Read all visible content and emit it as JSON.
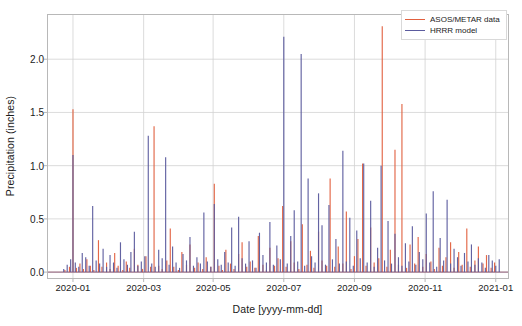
{
  "chart_data": {
    "type": "line",
    "title": "",
    "subtitle": "",
    "xlabel": "Date [yyyy-mm-dd]",
    "ylabel": "Precipitation (inches)",
    "xlim": [
      "2019-12-20",
      "2021-01-10"
    ],
    "ylim": [
      -0.06,
      2.42
    ],
    "grid": true,
    "grid_color": "#d0d0d0",
    "legend_position": "top-right",
    "xticks": [
      "2020-01",
      "2020-03",
      "2020-05",
      "2020-07",
      "2020-09",
      "2020-11",
      "2021-01"
    ],
    "xtick_days": [
      11,
      72,
      132,
      193,
      254,
      315,
      376
    ],
    "yticks": [
      0.0,
      0.5,
      1.0,
      1.5,
      2.0
    ],
    "ytick_labels": [
      "0.0",
      "0.5",
      "1.0",
      "1.5",
      "2.0"
    ],
    "colors": {
      "asos_metar": "#e2603f",
      "hrrr": "#5b5b9e",
      "axes": "#b8b8b8",
      "grid": "#d2d2d2",
      "text": "#1a1a1a"
    },
    "series": [
      {
        "name": "ASOS/METAR data",
        "color": "#e2603f",
        "unit": "inches",
        "x_day": [
          4,
          8,
          11,
          14,
          17,
          20,
          23,
          26,
          29,
          33,
          36,
          40,
          43,
          47,
          50,
          54,
          57,
          60,
          64,
          67,
          71,
          74,
          78,
          81,
          85,
          88,
          92,
          95,
          98,
          102,
          105,
          109,
          112,
          116,
          119,
          123,
          126,
          130,
          133,
          137,
          140,
          143,
          147,
          150,
          154,
          157,
          161,
          164,
          168,
          171,
          175,
          178,
          181,
          185,
          188,
          192,
          195,
          199,
          202,
          206,
          209,
          213,
          216,
          219,
          223,
          226,
          230,
          233,
          237,
          240,
          244,
          247,
          251,
          254,
          257,
          261,
          264,
          268,
          271,
          275,
          278,
          282,
          285,
          289,
          292,
          295,
          299,
          302,
          306,
          309,
          313,
          316,
          320,
          323,
          327,
          330,
          333,
          337,
          340,
          344,
          347,
          351,
          354,
          358,
          361,
          365,
          368,
          372,
          375
        ],
        "values": [
          0.02,
          0.05,
          1.53,
          0.04,
          0.08,
          0.03,
          0.12,
          0.06,
          0.02,
          0.3,
          0.05,
          0.09,
          0.03,
          0.18,
          0.06,
          0.02,
          0.1,
          0.04,
          0.22,
          0.07,
          0.03,
          0.15,
          0.05,
          1.37,
          0.06,
          0.03,
          0.11,
          0.41,
          0.05,
          0.02,
          0.19,
          0.07,
          0.26,
          0.04,
          0.09,
          0.03,
          0.14,
          0.05,
          0.83,
          0.06,
          0.02,
          0.21,
          0.08,
          0.03,
          0.17,
          0.28,
          0.05,
          0.1,
          0.04,
          0.34,
          0.07,
          0.02,
          0.23,
          0.06,
          0.13,
          0.62,
          0.05,
          0.29,
          0.09,
          0.03,
          0.45,
          0.07,
          0.2,
          0.04,
          0.38,
          0.11,
          0.06,
          0.88,
          0.05,
          0.24,
          0.08,
          0.57,
          0.03,
          0.15,
          0.31,
          1.02,
          0.06,
          0.42,
          0.09,
          0.13,
          2.31,
          0.05,
          0.21,
          1.15,
          0.07,
          1.58,
          0.04,
          0.26,
          0.08,
          0.33,
          0.05,
          0.17,
          0.1,
          0.03,
          0.23,
          0.06,
          0.14,
          0.28,
          0.04,
          0.19,
          0.07,
          0.41,
          0.05,
          0.11,
          0.24,
          0.08,
          0.16,
          0.04,
          0.09
        ]
      },
      {
        "name": "HRRR model",
        "color": "#5b5b9e",
        "unit": "inches",
        "x_day": [
          3,
          6,
          9,
          11,
          13,
          16,
          19,
          22,
          25,
          28,
          31,
          34,
          37,
          40,
          43,
          46,
          49,
          52,
          55,
          58,
          61,
          64,
          67,
          70,
          73,
          76,
          79,
          82,
          85,
          88,
          91,
          94,
          97,
          100,
          103,
          106,
          109,
          112,
          115,
          118,
          121,
          124,
          127,
          130,
          133,
          136,
          139,
          142,
          145,
          148,
          151,
          154,
          157,
          160,
          163,
          166,
          169,
          172,
          175,
          178,
          181,
          184,
          187,
          190,
          193,
          196,
          199,
          202,
          205,
          208,
          211,
          214,
          217,
          220,
          223,
          226,
          229,
          232,
          235,
          238,
          241,
          244,
          247,
          250,
          253,
          256,
          259,
          262,
          265,
          268,
          271,
          274,
          277,
          280,
          283,
          286,
          289,
          292,
          295,
          298,
          301,
          304,
          307,
          310,
          313,
          316,
          319,
          322,
          325,
          328,
          331,
          334,
          337,
          340,
          343,
          346,
          349,
          352,
          355,
          358,
          361,
          364,
          367,
          370,
          373,
          376,
          379
        ],
        "values": [
          0.03,
          0.07,
          0.12,
          1.1,
          0.09,
          0.05,
          0.18,
          0.14,
          0.06,
          0.62,
          0.11,
          0.08,
          0.22,
          0.05,
          0.16,
          0.09,
          0.04,
          0.28,
          0.12,
          0.07,
          0.19,
          0.38,
          0.06,
          0.1,
          0.15,
          1.28,
          0.08,
          0.05,
          0.21,
          0.13,
          1.08,
          0.07,
          0.24,
          0.09,
          0.04,
          0.17,
          0.11,
          0.33,
          0.06,
          0.14,
          0.08,
          0.56,
          0.1,
          0.05,
          0.64,
          0.12,
          0.07,
          0.19,
          0.09,
          0.42,
          0.06,
          0.52,
          0.13,
          0.08,
          0.29,
          0.11,
          0.04,
          0.37,
          0.16,
          0.09,
          0.47,
          0.07,
          0.25,
          0.12,
          2.21,
          0.08,
          0.34,
          0.58,
          0.1,
          2.05,
          0.06,
          0.88,
          0.15,
          0.09,
          0.74,
          0.44,
          0.07,
          0.63,
          0.12,
          0.31,
          0.08,
          1.14,
          0.1,
          0.51,
          0.06,
          0.39,
          0.13,
          1.02,
          0.09,
          0.67,
          0.05,
          0.23,
          1.0,
          0.11,
          0.48,
          0.08,
          0.36,
          0.14,
          0.06,
          0.27,
          0.1,
          0.43,
          0.07,
          0.19,
          0.12,
          0.55,
          0.09,
          0.76,
          0.05,
          0.32,
          0.11,
          0.68,
          0.08,
          0.22,
          0.14,
          0.06,
          0.18,
          0.1,
          0.26,
          0.07,
          0.13,
          0.09,
          0.04,
          0.16,
          0.11,
          0.06,
          0.12,
          0.08
        ]
      }
    ],
    "annotations": [
      {
        "text": "peak ASOS/METAR",
        "value": 2.31,
        "near": "2020-08"
      },
      {
        "text": "peak HRRR",
        "value": 2.21,
        "near": "2020-07"
      }
    ]
  },
  "legend": {
    "items": [
      {
        "label": "ASOS/METAR data",
        "color": "#e2603f"
      },
      {
        "label": "HRRR model",
        "color": "#5b5b9e"
      }
    ]
  }
}
